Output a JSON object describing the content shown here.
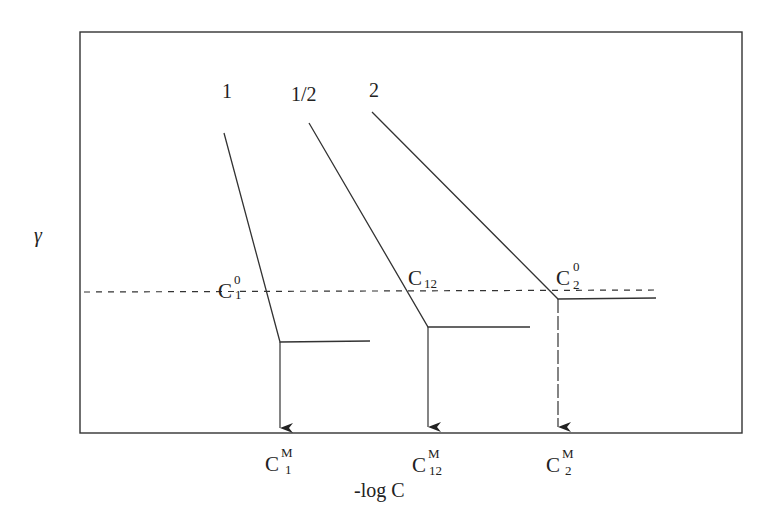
{
  "diagram": {
    "y_axis_label": "γ",
    "x_axis_label": "-log C",
    "curve_labels": [
      "1",
      "1/2",
      "2"
    ],
    "intersection_labels": [
      {
        "base": "C",
        "sup": "0",
        "sub": "1"
      },
      {
        "base": "C",
        "sub": "12"
      },
      {
        "base": "C",
        "sup": "0",
        "sub": "2"
      }
    ],
    "cmc_labels": [
      {
        "base": "C",
        "sup": "M",
        "sub": "1"
      },
      {
        "base": "C",
        "sup": "M",
        "sub": "12"
      },
      {
        "base": "C",
        "sup": "M",
        "sub": "2"
      }
    ]
  }
}
